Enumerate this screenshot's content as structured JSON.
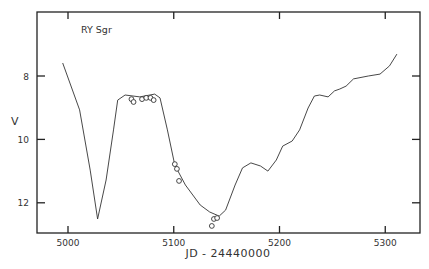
{
  "chart_data": {
    "type": "line",
    "title": "RY Sgr",
    "xlabel": "JD - 24440000",
    "ylabel": "V",
    "xlim": [
      4970,
      5330
    ],
    "ylim": [
      13.0,
      6.0
    ],
    "y_inverted": true,
    "grid": false,
    "legend": null,
    "x_ticks": [
      5000,
      5100,
      5200,
      5300
    ],
    "x_tick_labels": [
      "5000",
      "5100",
      "5200",
      "5300"
    ],
    "y_ticks": [
      8,
      10,
      12
    ],
    "y_tick_labels": [
      "8",
      "10",
      "12"
    ],
    "series": [
      {
        "name": "light curve",
        "style": "line",
        "x": [
          4995,
          5011,
          5021,
          5028,
          5036,
          5043,
          5047,
          5054,
          5068,
          5082,
          5087,
          5094,
          5101,
          5111,
          5125,
          5134,
          5143,
          5149,
          5158,
          5165,
          5173,
          5182,
          5189,
          5197,
          5203,
          5212,
          5219,
          5227,
          5233,
          5238,
          5246,
          5252,
          5257,
          5263,
          5270,
          5284,
          5295,
          5304,
          5311
        ],
        "y": [
          7.59,
          9.07,
          10.97,
          12.51,
          11.28,
          9.7,
          8.76,
          8.6,
          8.66,
          8.57,
          8.69,
          9.7,
          10.81,
          11.44,
          12.07,
          12.29,
          12.42,
          12.23,
          11.44,
          10.9,
          10.74,
          10.84,
          11.0,
          10.65,
          10.21,
          10.05,
          9.7,
          9.01,
          8.63,
          8.6,
          8.66,
          8.47,
          8.41,
          8.32,
          8.09,
          8.0,
          7.94,
          7.68,
          7.31
        ]
      },
      {
        "name": "observations",
        "style": "scatter",
        "marker": "open-circle",
        "x": [
          5060,
          5062,
          5070,
          5074,
          5078,
          5081,
          5101,
          5103,
          5105,
          5136,
          5138,
          5141
        ],
        "y": [
          8.73,
          8.82,
          8.73,
          8.69,
          8.69,
          8.76,
          10.78,
          10.93,
          11.31,
          12.73,
          12.51,
          12.48
        ]
      }
    ]
  },
  "colors": {
    "line": "#333333",
    "axis": "#222222",
    "background": "#ffffff"
  }
}
